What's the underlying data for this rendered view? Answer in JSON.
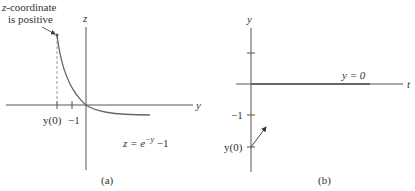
{
  "figure": {
    "panel_a": {
      "caption": "(a)",
      "vertical_axis_label": "z",
      "horizontal_axis_label": "y",
      "tick_labels": [
        "y(0)",
        "−1"
      ],
      "annotation_line1": "z-coordinate",
      "annotation_line2": "is positive",
      "equation_lhs": "z = e",
      "equation_exp": "−y",
      "equation_rhs": " −1",
      "curve": "z = e^{-y} - 1"
    },
    "panel_b": {
      "caption": "(b)",
      "vertical_axis_label": "y",
      "horizontal_axis_label": "t",
      "tick_labels": [
        "−1",
        "y(0)"
      ],
      "equilibrium_label": "y = 0"
    },
    "colors": {
      "axis": "#555555",
      "curve": "#666666",
      "dashed": "#999999",
      "text": "#333333"
    }
  }
}
